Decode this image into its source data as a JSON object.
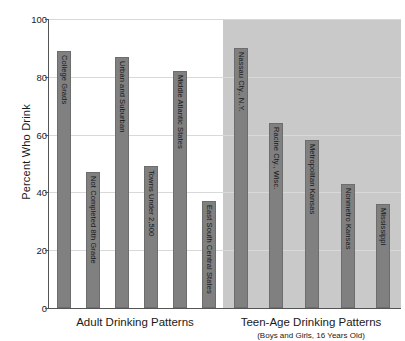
{
  "chart_data": {
    "type": "bar",
    "title": "",
    "xlabel": "",
    "ylabel": "Percent Who Drink",
    "ylim": [
      0,
      100
    ],
    "yticks": [
      0,
      20,
      40,
      60,
      80,
      100
    ],
    "grid": true,
    "legend": false,
    "groups": [
      {
        "name": "Adult Drinking Patterns",
        "caption": "Adult Drinking Patterns",
        "subcaption": "",
        "shaded": false,
        "categories": [
          "College Grads",
          "Not Completed 8th Grade",
          "Urban and Suburban",
          "Towns Under 2,500",
          "Middle Atlantic States",
          "East South Central States"
        ],
        "values": [
          89,
          47,
          87,
          49,
          82,
          37
        ]
      },
      {
        "name": "Teen-Age Drinking Patterns",
        "caption": "Teen-Age Drinking Patterns",
        "subcaption": "(Boys and Girls, 16 Years Old)",
        "shaded": true,
        "categories": [
          "Nassau Cty., N.Y.",
          "Racine Cty., Wisc.",
          "Metropolitan Kansas",
          "Nonmetro Kansas",
          "Mississippi"
        ],
        "values": [
          90,
          64,
          58,
          43,
          36
        ]
      }
    ],
    "colors": {
      "bar": "#808080",
      "bar_border": "#6d6d6d",
      "shaded_panel": "#c9c9c9",
      "gridline": "#d9d9d9",
      "axis": "#555555",
      "background": "#ffffff",
      "text": "#1a1a1a"
    }
  }
}
